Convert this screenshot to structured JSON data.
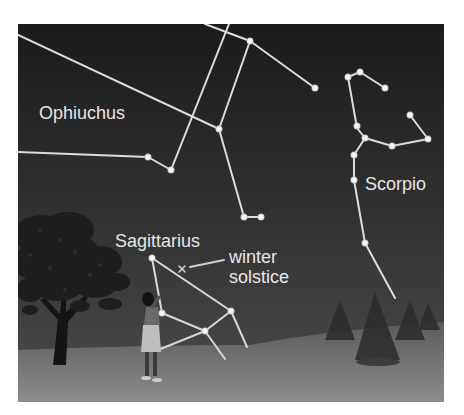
{
  "figure": {
    "colors": {
      "sky_top": "#1c1c1c",
      "sky_bottom": "#4a4a4a",
      "ground_top": "#555555",
      "ground_bottom": "#8a8a8a",
      "star": "#f2f2f2",
      "line": "#e0e0e0",
      "label": "#e6e6e6"
    },
    "labels": {
      "ophiuchus": "Ophiuchus",
      "scorpio": "Scorpio",
      "sagittarius": "Sagittarius",
      "winter": "winter",
      "solstice": "solstice"
    },
    "marker": {
      "symbol": "×",
      "meaning": "winter solstice"
    },
    "constellations": [
      {
        "name": "Ophiuchus",
        "star_count": 7
      },
      {
        "name": "Scorpio",
        "star_count": 12
      },
      {
        "name": "Sagittarius",
        "star_count": 4
      }
    ]
  }
}
